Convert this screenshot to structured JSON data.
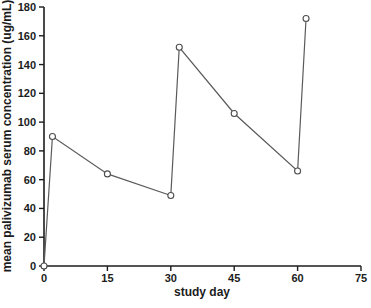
{
  "chart_data": {
    "type": "line",
    "title": "",
    "xlabel": "study day",
    "ylabel": "mean palivizumab serum concentration (ug/mL)",
    "x": [
      0,
      2,
      15,
      30,
      32,
      45,
      60,
      62
    ],
    "y": [
      0,
      90,
      64,
      49,
      152,
      106,
      66,
      172
    ],
    "xlim": [
      0,
      75
    ],
    "ylim": [
      0,
      180
    ],
    "xticks": [
      0,
      15,
      30,
      45,
      60,
      75
    ],
    "yticks": [
      0,
      20,
      40,
      60,
      80,
      100,
      120,
      140,
      160,
      180
    ],
    "grid": false,
    "legend": null,
    "marker": "open-circle",
    "colors": {
      "axis": "#1c1c1c",
      "line": "#5a5a5a",
      "marker_stroke": "#4d4d4d",
      "marker_fill": "#ffffff",
      "background": "#ffffff"
    }
  }
}
